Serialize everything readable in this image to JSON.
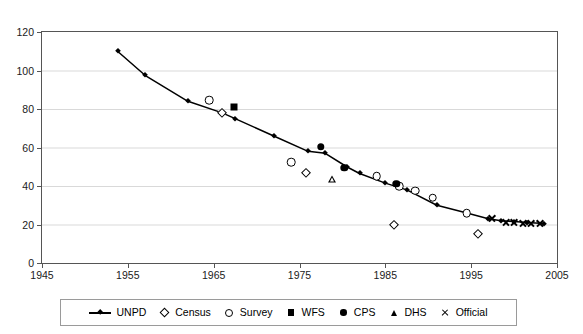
{
  "chart_data": {
    "type": "scatter",
    "title": "",
    "xlabel": "",
    "ylabel": "",
    "xlim": [
      1945,
      2005
    ],
    "ylim": [
      0,
      120
    ],
    "xticks": [
      1945,
      1955,
      1965,
      1975,
      1985,
      1995,
      2005
    ],
    "yticks": [
      0,
      20,
      40,
      60,
      80,
      100,
      120
    ],
    "grid": "horizontal",
    "legend_position": "bottom",
    "series": [
      {
        "name": "UNPD",
        "marker": "line-diamond",
        "points": [
          {
            "x": 1953.8,
            "y": 110.0
          },
          {
            "x": 1957.0,
            "y": 97.5
          },
          {
            "x": 1962.0,
            "y": 84.0
          },
          {
            "x": 1966.0,
            "y": 78.0
          },
          {
            "x": 1967.5,
            "y": 75.0
          },
          {
            "x": 1972.0,
            "y": 66.0
          },
          {
            "x": 1976.0,
            "y": 58.0
          },
          {
            "x": 1978.0,
            "y": 57.0
          },
          {
            "x": 1980.5,
            "y": 50.0
          },
          {
            "x": 1982.0,
            "y": 46.5
          },
          {
            "x": 1985.0,
            "y": 41.5
          },
          {
            "x": 1987.5,
            "y": 38.0
          },
          {
            "x": 1991.0,
            "y": 30.0
          },
          {
            "x": 1994.5,
            "y": 26.0
          },
          {
            "x": 1997.0,
            "y": 23.0
          },
          {
            "x": 1998.5,
            "y": 22.0
          },
          {
            "x": 2000.0,
            "y": 21.5
          },
          {
            "x": 2001.5,
            "y": 21.0
          },
          {
            "x": 2003.5,
            "y": 20.5
          }
        ]
      },
      {
        "name": "Census",
        "marker": "open-diamond",
        "points": [
          {
            "x": 1966.0,
            "y": 78.0
          },
          {
            "x": 1975.7,
            "y": 47.0
          },
          {
            "x": 1986.0,
            "y": 20.0
          },
          {
            "x": 1995.8,
            "y": 15.0
          }
        ]
      },
      {
        "name": "Survey",
        "marker": "open-circle",
        "points": [
          {
            "x": 1964.5,
            "y": 84.5
          },
          {
            "x": 1974.0,
            "y": 52.5
          },
          {
            "x": 1984.0,
            "y": 45.0
          },
          {
            "x": 1986.6,
            "y": 40.0
          },
          {
            "x": 1988.5,
            "y": 37.5
          },
          {
            "x": 1990.5,
            "y": 34.0
          },
          {
            "x": 1994.5,
            "y": 26.0
          }
        ]
      },
      {
        "name": "WFS",
        "marker": "filled-square",
        "points": [
          {
            "x": 1967.4,
            "y": 81.0
          }
        ]
      },
      {
        "name": "CPS",
        "marker": "filled-circle",
        "points": [
          {
            "x": 1977.5,
            "y": 60.5
          },
          {
            "x": 1980.2,
            "y": 49.5
          },
          {
            "x": 1986.3,
            "y": 41.0
          }
        ]
      },
      {
        "name": "DHS",
        "marker": "open-triangle",
        "points": [
          {
            "x": 1978.8,
            "y": 43.5
          }
        ]
      },
      {
        "name": "Official",
        "marker": "cross",
        "points": [
          {
            "x": 1997.4,
            "y": 23.5
          },
          {
            "x": 1999.0,
            "y": 21.5
          },
          {
            "x": 2000.0,
            "y": 21.3
          },
          {
            "x": 2001.0,
            "y": 21.0
          },
          {
            "x": 2002.0,
            "y": 20.8
          },
          {
            "x": 2003.0,
            "y": 20.6
          }
        ]
      }
    ]
  },
  "axes": {
    "y_tick_labels": [
      "120",
      "100",
      "80",
      "60",
      "40",
      "20",
      "0"
    ],
    "x_tick_labels": [
      "1945",
      "1955",
      "1965",
      "1975",
      "1985",
      "1995",
      "2005"
    ]
  },
  "legend": {
    "items": [
      {
        "label": "UNPD",
        "symbol": "line-diamond-icon"
      },
      {
        "label": "Census",
        "symbol": "open-diamond-icon"
      },
      {
        "label": "Survey",
        "symbol": "open-circle-icon"
      },
      {
        "label": "WFS",
        "symbol": "filled-square-icon"
      },
      {
        "label": "CPS",
        "symbol": "filled-circle-icon"
      },
      {
        "label": "DHS",
        "symbol": "open-triangle-icon"
      },
      {
        "label": "Official",
        "symbol": "cross-icon"
      }
    ]
  },
  "colors": {
    "series": "#000000",
    "grid": "#d9d9d9",
    "axis": "#555555",
    "background": "#ffffff"
  }
}
